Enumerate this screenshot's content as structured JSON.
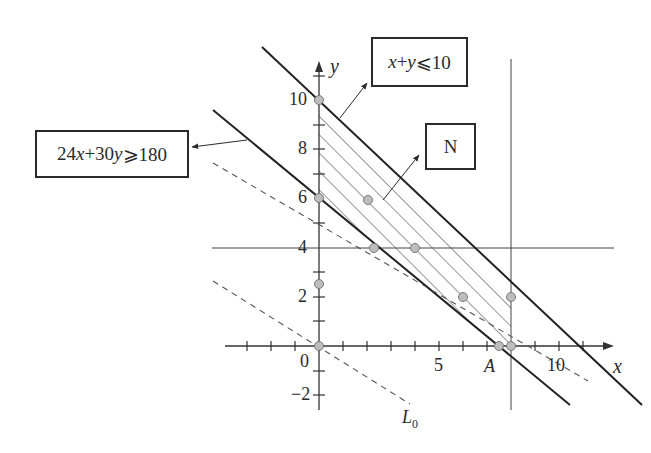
{
  "diagram": {
    "type": "linear-programming-feasible-region",
    "axes": {
      "x_label": "x",
      "y_label": "y",
      "x_ticks": [
        "0",
        "5",
        "10"
      ],
      "y_ticks": [
        "10",
        "8",
        "6",
        "4",
        "2",
        "0",
        "−2"
      ],
      "origin_label": "0"
    },
    "constraints": [
      {
        "label_parts": [
          "24",
          "x",
          "+30",
          "y",
          "⩾180"
        ],
        "text": "24x+30y⩾180"
      },
      {
        "label_parts": [
          "x",
          "+",
          "y",
          "⩽10"
        ],
        "text": "x+y⩽10"
      }
    ],
    "lines": [
      {
        "name": "x+y=10",
        "style": "solid"
      },
      {
        "name": "24x+30y=180",
        "style": "solid"
      },
      {
        "name": "x=8",
        "style": "thin"
      },
      {
        "name": "y=4",
        "style": "thin"
      },
      {
        "name": "L0 through origin",
        "style": "dashed"
      },
      {
        "name": "L0 shifted",
        "style": "dashed"
      }
    ],
    "region_label": "N",
    "point_label_A": "A",
    "dashed_line_label": "L",
    "dashed_line_label_sub": "0",
    "points": [
      {
        "x": 0,
        "y": 10
      },
      {
        "x": 0,
        "y": 6
      },
      {
        "x": 0,
        "y": 2.5
      },
      {
        "x": 0,
        "y": 0
      },
      {
        "x": 2,
        "y": 6
      },
      {
        "x": 2.5,
        "y": 4
      },
      {
        "x": 4,
        "y": 4
      },
      {
        "x": 6,
        "y": 2
      },
      {
        "x": 8,
        "y": 2
      },
      {
        "x": 7.5,
        "y": 0
      },
      {
        "x": 8,
        "y": 0
      }
    ],
    "colors": {
      "ink": "#2a2a2a",
      "point_fill": "#bdbdbd",
      "point_stroke": "#777777"
    }
  }
}
